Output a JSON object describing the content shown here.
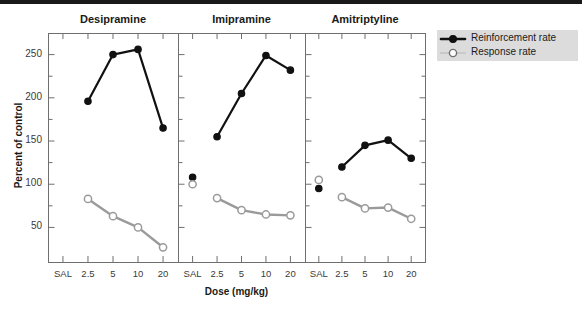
{
  "chart_data": {
    "type": "line",
    "title": "",
    "xlabel": "Dose (mg/kg)",
    "ylabel": "Percent of control",
    "categories": [
      "SAL",
      "2.5",
      "5",
      "10",
      "20"
    ],
    "ylim": [
      10,
      275
    ],
    "yticks": [
      50,
      75,
      100,
      125,
      150,
      175,
      200,
      225,
      250
    ],
    "ytick_labels": [
      "50",
      "",
      "100",
      "",
      "150",
      "",
      "200",
      "",
      "250"
    ],
    "grid": false,
    "legend_position": "right",
    "panels": [
      {
        "title": "Desipramine",
        "series": [
          {
            "name": "Reinforcement rate",
            "marker": "filled-circle",
            "color": "#111111",
            "values": [
              null,
              196,
              250,
              256,
              165
            ]
          },
          {
            "name": "Response rate",
            "marker": "open-circle",
            "color": "#9a9a9a",
            "values": [
              null,
              83,
              63,
              50,
              27
            ]
          }
        ]
      },
      {
        "title": "Imipramine",
        "series": [
          {
            "name": "Reinforcement rate",
            "marker": "filled-circle",
            "color": "#111111",
            "values": [
              108,
              155,
              205,
              249,
              232
            ]
          },
          {
            "name": "Response rate",
            "marker": "open-circle",
            "color": "#9a9a9a",
            "values": [
              100,
              84,
              70,
              65,
              64
            ]
          }
        ]
      },
      {
        "title": "Amitriptyline",
        "series": [
          {
            "name": "Reinforcement rate",
            "marker": "filled-circle",
            "color": "#111111",
            "values": [
              95,
              120,
              145,
              151,
              130
            ]
          },
          {
            "name": "Response rate",
            "marker": "open-circle",
            "color": "#9a9a9a",
            "values": [
              105,
              85,
              72,
              73,
              60
            ]
          }
        ]
      }
    ],
    "legend": [
      {
        "label": "Reinforcement rate",
        "marker": "filled-circle",
        "color": "#111111"
      },
      {
        "label": "Response rate",
        "marker": "open-circle",
        "color": "#9a9a9a"
      }
    ]
  }
}
